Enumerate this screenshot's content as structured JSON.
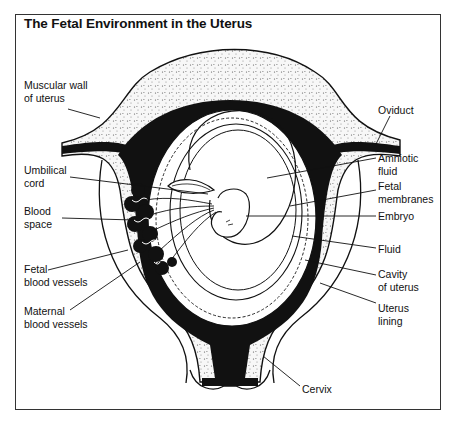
{
  "title": "The Fetal Environment in the Uterus",
  "labels": {
    "left": [
      {
        "id": "muscular-wall",
        "lines": [
          "Muscular wall",
          "of uterus"
        ]
      },
      {
        "id": "umbilical-cord",
        "lines": [
          "Umbilical",
          "cord"
        ]
      },
      {
        "id": "blood-space",
        "lines": [
          "Blood",
          "space"
        ]
      },
      {
        "id": "fetal-blood-vessels",
        "lines": [
          "Fetal",
          "blood vessels"
        ]
      },
      {
        "id": "maternal-blood-vessels",
        "lines": [
          "Maternal",
          "blood vessels"
        ]
      }
    ],
    "right": [
      {
        "id": "oviduct",
        "lines": [
          "Oviduct"
        ]
      },
      {
        "id": "amniotic-fluid",
        "lines": [
          "Amniotic",
          "fluid"
        ]
      },
      {
        "id": "fetal-membranes",
        "lines": [
          "Fetal",
          "membranes"
        ]
      },
      {
        "id": "embryo",
        "lines": [
          "Embryo"
        ]
      },
      {
        "id": "fluid",
        "lines": [
          "Fluid"
        ]
      },
      {
        "id": "cavity-of-uterus",
        "lines": [
          "Cavity",
          "of uterus"
        ]
      },
      {
        "id": "uterus-lining",
        "lines": [
          "Uterus",
          "lining"
        ]
      }
    ],
    "bottom": [
      {
        "id": "cervix",
        "lines": [
          "Cervix"
        ]
      }
    ]
  },
  "colors": {
    "ink": "#111111",
    "stipple": "#f2f2f2",
    "frame": "#333333"
  }
}
